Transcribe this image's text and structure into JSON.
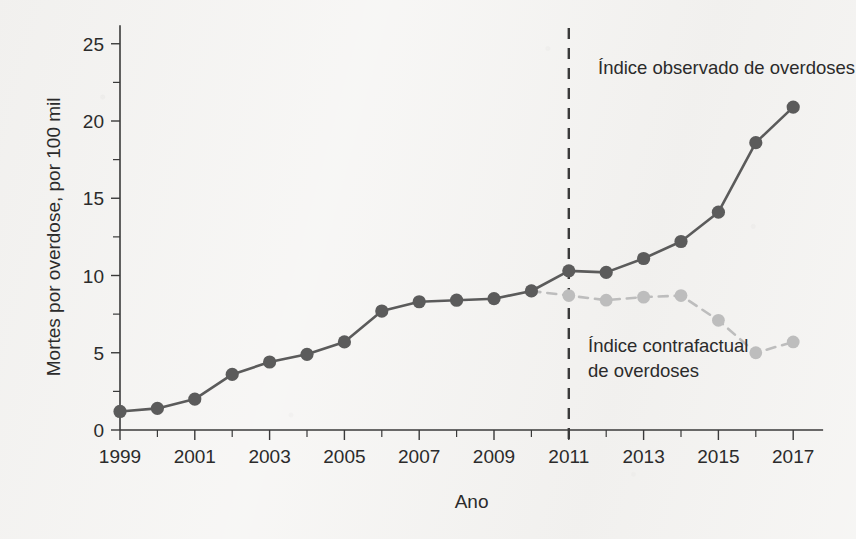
{
  "chart_data": {
    "type": "line",
    "title": "",
    "xlabel": "Ano",
    "ylabel": "Mortes por overdose, por 100 mil",
    "xlim": [
      1998.4,
      2017.8
    ],
    "ylim": [
      0,
      26.2
    ],
    "grid": false,
    "legend_position": "inline-annotations",
    "x": [
      1999,
      2000,
      2001,
      2002,
      2003,
      2004,
      2005,
      2006,
      2007,
      2008,
      2009,
      2010,
      2011,
      2012,
      2013,
      2014,
      2015,
      2016,
      2017
    ],
    "xticks": [
      1999,
      2001,
      2003,
      2005,
      2007,
      2009,
      2011,
      2013,
      2015,
      2017
    ],
    "xtick_labels": [
      "1999",
      "2001",
      "2003",
      "2005",
      "2007",
      "2009",
      "2011",
      "2013",
      "2015",
      "2017"
    ],
    "xticks_minor": [
      2000,
      2002,
      2004,
      2006,
      2008,
      2010,
      2012,
      2014,
      2016
    ],
    "yticks": [
      0,
      5,
      10,
      15,
      20,
      25
    ],
    "ytick_labels": [
      "0",
      "5",
      "10",
      "15",
      "20",
      "25"
    ],
    "yticks_minor": [
      2.5,
      7.5,
      12.5,
      17.5,
      22.5
    ],
    "series": [
      {
        "name": "Índice observado de overdoses",
        "style": "solid",
        "color": "#5b5b5b",
        "marker": "circle",
        "x": [
          1999,
          2000,
          2001,
          2002,
          2003,
          2004,
          2005,
          2006,
          2007,
          2008,
          2009,
          2010,
          2011,
          2012,
          2013,
          2014,
          2015,
          2016,
          2017
        ],
        "values": [
          1.2,
          1.4,
          2.0,
          3.6,
          4.4,
          4.9,
          5.7,
          7.7,
          8.3,
          8.4,
          8.5,
          9.0,
          10.3,
          10.2,
          11.1,
          12.2,
          14.1,
          18.6,
          20.9
        ]
      },
      {
        "name": "Índice contrafactual de overdoses",
        "style": "dashed",
        "color": "#bdbdbd",
        "marker": "circle",
        "x": [
          2010,
          2011,
          2012,
          2013,
          2014,
          2015,
          2016,
          2017
        ],
        "values": [
          9.0,
          8.7,
          8.4,
          8.6,
          8.7,
          7.1,
          5.0,
          5.7
        ]
      }
    ],
    "annotations": [
      {
        "id": "observed-label",
        "lines": [
          "Índice observado de overdoses"
        ],
        "x": 598,
        "y": 74
      },
      {
        "id": "counterfactual-label",
        "lines": [
          "Índice contrafactual",
          "de overdoses"
        ],
        "x": 588,
        "y": 352
      }
    ],
    "reference_line": {
      "id": "intervention-year",
      "x": 2011,
      "style": "dashed",
      "color": "#3a3a3a"
    }
  },
  "colors": {
    "background": "#f4f3f1",
    "axis": "#3a3a3a",
    "observed": "#5b5b5b",
    "counterfactual": "#bdbdbd",
    "text": "#2b2b2b"
  }
}
